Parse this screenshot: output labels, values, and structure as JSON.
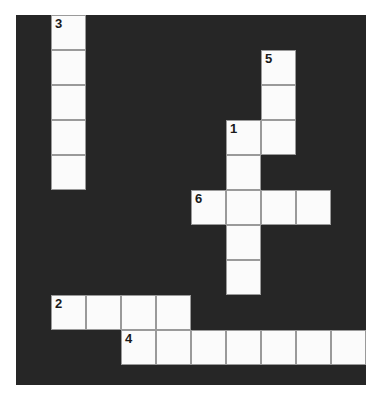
{
  "puzzle": {
    "type": "crossword-grid",
    "title": "Crossword Puzzle Grid",
    "colors": {
      "block": "#262626",
      "cell": "#fbfbfb",
      "cell_border": "#9a9a9a",
      "number_text": "#1a1a1a",
      "page_background": "#ffffff"
    },
    "geometry": {
      "origin_x": 16,
      "origin_y": 15,
      "cell_size": 35,
      "columns": 10,
      "rows": 11,
      "board_width": 350,
      "board_height": 370
    },
    "entries": [
      {
        "number": "1",
        "direction": "down",
        "col": 6,
        "row": 3,
        "length": 3
      },
      {
        "number": "1",
        "direction": "across",
        "col": 6,
        "row": 3,
        "length": 2
      },
      {
        "number": "2",
        "direction": "across",
        "col": 1,
        "row": 8,
        "length": 4
      },
      {
        "number": "3",
        "direction": "down",
        "col": 1,
        "row": 0,
        "length": 5
      },
      {
        "number": "4",
        "direction": "across",
        "col": 3,
        "row": 9,
        "length": 7
      },
      {
        "number": "5",
        "direction": "down",
        "col": 7,
        "row": 1,
        "length": 3
      },
      {
        "number": "6",
        "direction": "across",
        "col": 5,
        "row": 5,
        "length": 4
      }
    ],
    "cells": [
      {
        "col": 1,
        "row": 0,
        "number": "3"
      },
      {
        "col": 1,
        "row": 1,
        "number": ""
      },
      {
        "col": 1,
        "row": 2,
        "number": ""
      },
      {
        "col": 1,
        "row": 3,
        "number": ""
      },
      {
        "col": 1,
        "row": 4,
        "number": ""
      },
      {
        "col": 7,
        "row": 1,
        "number": "5"
      },
      {
        "col": 7,
        "row": 2,
        "number": ""
      },
      {
        "col": 7,
        "row": 3,
        "number": ""
      },
      {
        "col": 6,
        "row": 3,
        "number": "1"
      },
      {
        "col": 6,
        "row": 4,
        "number": ""
      },
      {
        "col": 5,
        "row": 5,
        "number": "6"
      },
      {
        "col": 6,
        "row": 5,
        "number": ""
      },
      {
        "col": 7,
        "row": 5,
        "number": ""
      },
      {
        "col": 8,
        "row": 5,
        "number": ""
      },
      {
        "col": 6,
        "row": 6,
        "number": ""
      },
      {
        "col": 6,
        "row": 7,
        "number": ""
      },
      {
        "col": 1,
        "row": 8,
        "number": "2"
      },
      {
        "col": 2,
        "row": 8,
        "number": ""
      },
      {
        "col": 3,
        "row": 8,
        "number": ""
      },
      {
        "col": 4,
        "row": 8,
        "number": ""
      },
      {
        "col": 3,
        "row": 9,
        "number": "4"
      },
      {
        "col": 4,
        "row": 9,
        "number": ""
      },
      {
        "col": 5,
        "row": 9,
        "number": ""
      },
      {
        "col": 6,
        "row": 9,
        "number": ""
      },
      {
        "col": 7,
        "row": 9,
        "number": ""
      },
      {
        "col": 8,
        "row": 9,
        "number": ""
      },
      {
        "col": 9,
        "row": 9,
        "number": ""
      }
    ]
  }
}
